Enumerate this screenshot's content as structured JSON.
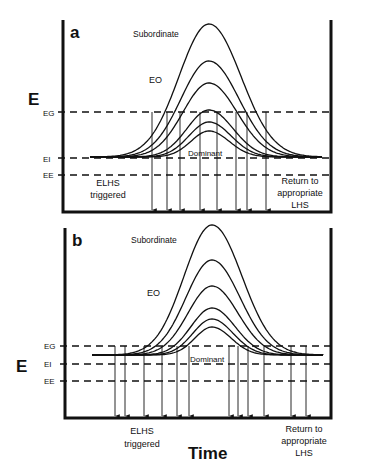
{
  "figure": {
    "y_axis_label": "E",
    "x_axis_label": "Time",
    "colors": {
      "ink": "#111111",
      "background": "#ffffff"
    }
  },
  "panels": [
    {
      "id": "a",
      "panel_label": "a",
      "curve_top_label": "Subordinate",
      "curve_mid_label": "EO",
      "curve_bottom_label": "Dominant",
      "levels": [
        {
          "key": "EG",
          "label": "EG"
        },
        {
          "key": "EI",
          "label": "EI"
        },
        {
          "key": "EE",
          "label": "EE"
        }
      ],
      "left_note": [
        "ELHS",
        "triggered"
      ],
      "right_note": [
        "Return to",
        "appropriate",
        "LHS"
      ],
      "curve_count": 6,
      "arrow_count": 8
    },
    {
      "id": "b",
      "panel_label": "b",
      "curve_top_label": "Subordinate",
      "curve_mid_label": "EO",
      "curve_bottom_label": "Dominant",
      "levels": [
        {
          "key": "EG",
          "label": "EG"
        },
        {
          "key": "EI",
          "label": "EI"
        },
        {
          "key": "EE",
          "label": "EE"
        }
      ],
      "left_note": [
        "ELHS",
        "triggered"
      ],
      "right_note": [
        "Return to",
        "appropriate",
        "LHS"
      ],
      "curve_count": 6,
      "arrow_count": 12
    }
  ]
}
